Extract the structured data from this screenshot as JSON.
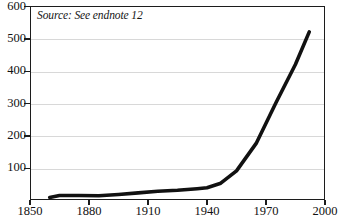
{
  "chart_data": {
    "type": "line",
    "title": "",
    "subtitle": "",
    "annotation": "Source: See endnote 12",
    "xlabel": "",
    "ylabel": "",
    "xlim": [
      1850,
      2000
    ],
    "ylim": [
      0,
      600
    ],
    "grid": true,
    "legend": false,
    "legend_position": "none",
    "x_ticks": [
      "1850",
      "1880",
      "1910",
      "1940",
      "1970",
      "2000"
    ],
    "x_tick_values": [
      1850,
      1880,
      1910,
      1940,
      1970,
      2000
    ],
    "y_ticks": [
      "100",
      "200",
      "300",
      "400",
      "500",
      "600"
    ],
    "y_tick_values": [
      100,
      200,
      300,
      400,
      500,
      600
    ],
    "line_color": "#111111",
    "grid_color": "#d8d8d8",
    "axis_color": "#1c1c1c",
    "series": [
      {
        "name": "series-1",
        "x": [
          1860,
          1865,
          1875,
          1885,
          1895,
          1905,
          1915,
          1925,
          1935,
          1940,
          1947,
          1955,
          1965,
          1975,
          1985,
          1992
        ],
        "values": [
          8,
          14,
          14,
          13,
          17,
          22,
          27,
          30,
          35,
          38,
          52,
          90,
          175,
          300,
          420,
          520
        ]
      }
    ]
  },
  "axis": {
    "y_labels": [
      "600",
      "500",
      "400",
      "300",
      "200",
      "100"
    ],
    "x_labels": [
      "1850",
      "1880",
      "1910",
      "1940",
      "1970",
      "2000"
    ]
  },
  "note": {
    "text": "Source: See endnote 12"
  }
}
